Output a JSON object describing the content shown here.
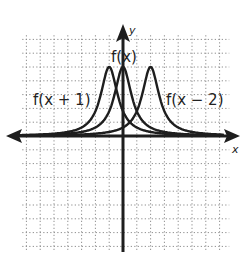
{
  "chart_data": {
    "type": "line",
    "title": "",
    "xlabel": "x",
    "ylabel": "y",
    "xlim": [
      -7,
      8
    ],
    "ylim": [
      -8.5,
      7.5
    ],
    "grid": true,
    "grid_style": "dotted",
    "legend": "inline labels",
    "series": [
      {
        "name": "f(x)",
        "peak_x": 0,
        "peak_y": 5,
        "shape": "bell/peak, tails approach x-axis"
      },
      {
        "name": "f(x + 1)",
        "peak_x": -1,
        "peak_y": 5,
        "shape": "f(x) shifted left 1"
      },
      {
        "name": "f(x − 2)",
        "peak_x": 2,
        "peak_y": 5,
        "shape": "f(x) shifted right 2"
      }
    ],
    "annotations": [
      {
        "text": "f(x)",
        "x": 0.2,
        "y": 5.8
      },
      {
        "text": "f(x + 1)",
        "x": -4.5,
        "y": 2.6
      },
      {
        "text": "f(x − 2)",
        "x": 4.5,
        "y": 2.6
      }
    ]
  },
  "labels": {
    "y_axis": "y",
    "x_axis": "x",
    "f": "f(x)",
    "f_plus_1": "f(x + 1)",
    "f_minus_2": "f(x − 2)"
  },
  "style": {
    "ink": "#1e1e1e",
    "grid": "#8a8a8a",
    "background": "#ffffff"
  }
}
